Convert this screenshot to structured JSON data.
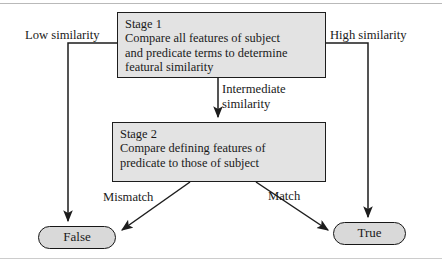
{
  "figure": {
    "type": "flowchart"
  },
  "nodes": {
    "stage1": {
      "title": "Stage 1",
      "line2": "Compare all features of subject",
      "line3": "and predicate terms to determine",
      "line4": "featural similarity"
    },
    "stage2": {
      "title": "Stage 2",
      "line2": "Compare defining features of",
      "line3": "predicate to those of subject"
    },
    "false_terminal": "False",
    "true_terminal": "True"
  },
  "edges": {
    "low": "Low similarity",
    "high": "High similarity",
    "intermediate_line1": "Intermediate",
    "intermediate_line2": "similarity",
    "mismatch": "Mismatch",
    "match": "Match"
  },
  "colors": {
    "box_fill": "#e3e3e3",
    "pill_fill": "#d9d9d9",
    "stroke": "#1d1d1d",
    "text": "#1a1a1a",
    "page": "#ffffff",
    "rule": "#b9b9b9"
  }
}
